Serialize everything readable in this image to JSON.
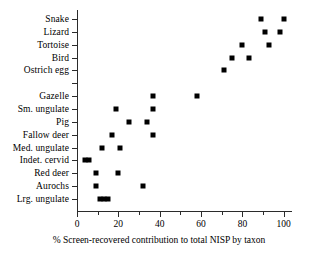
{
  "figure": {
    "background_color": "#ffffff",
    "marker_color": "#000000",
    "axis_color": "#2b2b2b"
  },
  "chart_data": {
    "type": "scatter",
    "title": "",
    "subtitle": "",
    "xlabel": "% Screen-recovered contribution to total NISP by taxon",
    "ylabel": "",
    "xlim": [
      0,
      104
    ],
    "ylim_categories_top_to_bottom": true,
    "grid": false,
    "legend": null,
    "annotations": [],
    "xticks_major": [
      0,
      20,
      40,
      60,
      80,
      100
    ],
    "xticks_major_labels": [
      "0",
      "20",
      "40",
      "60",
      "80",
      "100"
    ],
    "xticks_minor": [
      10,
      30,
      50,
      70,
      90
    ],
    "categories": [
      "Snake",
      "Lizard",
      "Tortoise",
      "Bird",
      "Ostrich egg",
      "",
      "Gazelle",
      "Sm. ungulate",
      "Pig",
      "Fallow deer",
      "Med. ungulate",
      "Indet. cervid",
      "Red deer",
      "Aurochs",
      "Lrg. ungulate"
    ],
    "points": [
      {
        "category": "Snake",
        "row": 0,
        "values": [
          89,
          100
        ]
      },
      {
        "category": "Lizard",
        "row": 1,
        "values": [
          91,
          98
        ]
      },
      {
        "category": "Tortoise",
        "row": 2,
        "values": [
          80,
          93
        ]
      },
      {
        "category": "Bird",
        "row": 3,
        "values": [
          75,
          83
        ]
      },
      {
        "category": "Ostrich egg",
        "row": 4,
        "values": [
          71
        ]
      },
      {
        "category": "Gazelle",
        "row": 6,
        "values": [
          37,
          58
        ]
      },
      {
        "category": "Sm. ungulate",
        "row": 7,
        "values": [
          19,
          37
        ]
      },
      {
        "category": "Pig",
        "row": 8,
        "values": [
          25,
          34
        ]
      },
      {
        "category": "Fallow deer",
        "row": 9,
        "values": [
          17,
          37
        ]
      },
      {
        "category": "Med. ungulate",
        "row": 10,
        "values": [
          12,
          21
        ]
      },
      {
        "category": "Indet. cervid",
        "row": 11,
        "values": [
          4,
          6
        ]
      },
      {
        "category": "Red deer",
        "row": 12,
        "values": [
          9,
          20
        ]
      },
      {
        "category": "Aurochs",
        "row": 13,
        "values": [
          9,
          32
        ]
      },
      {
        "category": "Lrg. ungulate",
        "row": 14,
        "values": [
          11,
          13,
          15
        ]
      }
    ]
  }
}
